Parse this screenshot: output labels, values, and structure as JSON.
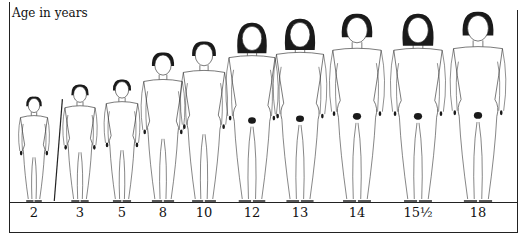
{
  "caption": "Age in years",
  "figures": [
    {
      "age": "2",
      "x": 34,
      "head_top": 97,
      "scale": 0.5,
      "hair": "short",
      "staff": true
    },
    {
      "age": "3",
      "x": 80,
      "head_top": 85,
      "scale": 0.55,
      "hair": "short"
    },
    {
      "age": "5",
      "x": 122,
      "head_top": 80,
      "scale": 0.57,
      "hair": "short"
    },
    {
      "age": "8",
      "x": 163,
      "head_top": 53,
      "scale": 0.69,
      "hair": "short"
    },
    {
      "age": "10",
      "x": 204,
      "head_top": 42,
      "scale": 0.74,
      "hair": "short"
    },
    {
      "age": "12",
      "x": 252,
      "head_top": 24,
      "scale": 0.83,
      "hair": "long"
    },
    {
      "age": "13",
      "x": 300,
      "head_top": 20,
      "scale": 0.85,
      "hair": "long"
    },
    {
      "age": "14",
      "x": 357,
      "head_top": 15,
      "scale": 0.88,
      "hair": "medium"
    },
    {
      "age": "15½",
      "x": 418,
      "head_top": 15,
      "scale": 0.88,
      "hair": "long"
    },
    {
      "age": "18",
      "x": 478,
      "head_top": 13,
      "scale": 0.89,
      "hair": "medium"
    }
  ],
  "labels": [
    "2",
    "3",
    "5",
    "8",
    "10",
    "12",
    "13",
    "14",
    "15½",
    "18"
  ],
  "colors": {
    "line": "#222222",
    "hair": "#1a1a1a",
    "background": "#ffffff"
  }
}
